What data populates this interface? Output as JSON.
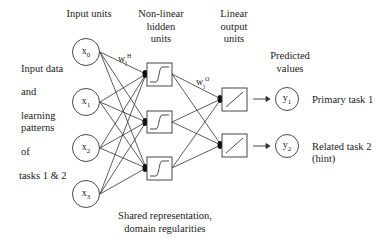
{
  "diagram": {
    "headers": {
      "input_units": "Input units",
      "hidden_units": [
        "Non-linear",
        "hidden",
        "units"
      ],
      "output_units": [
        "Linear",
        "output",
        "units"
      ],
      "predicted": [
        "Predicted",
        "values"
      ]
    },
    "left_text": [
      "Input data",
      "and",
      "learning",
      "patterns",
      "of",
      "tasks 1 & 2"
    ],
    "inputs": [
      {
        "base": "x",
        "sub": "0"
      },
      {
        "base": "x",
        "sub": "1"
      },
      {
        "base": "x",
        "sub": "2"
      },
      {
        "base": "x",
        "sub": "3"
      }
    ],
    "weights": {
      "hidden": {
        "base": "w",
        "sub": "j",
        "sup": "H"
      },
      "output": {
        "base": "w",
        "sub": "j",
        "sup": "O"
      }
    },
    "outputs": [
      {
        "base": "y",
        "sub": "1",
        "label": "Primary task 1"
      },
      {
        "base": "y",
        "sub": "2",
        "label": "Related task 2",
        "label2": "(hint)"
      }
    ],
    "bottom_text": [
      "Shared representation,",
      "domain regularities"
    ],
    "colors": {
      "stroke": "#333333",
      "background": "#ffffff"
    }
  }
}
